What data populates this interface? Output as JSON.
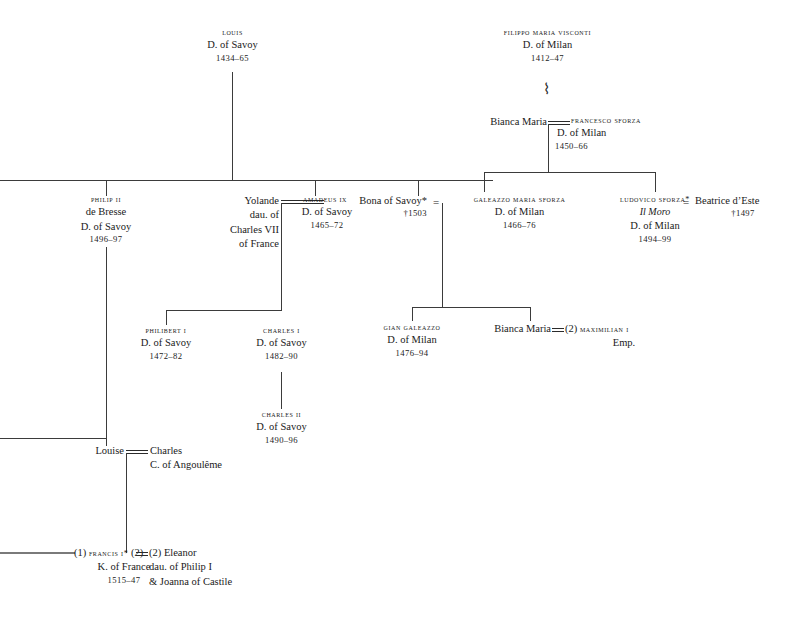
{
  "chart_title": "Genealogical table of the Houses of Savoy, Visconti and Sforza",
  "nodes": {
    "louis": {
      "name": "LOUIS",
      "realm": "D. of Savoy",
      "dates": "1434–65"
    },
    "filippo": {
      "name": "FILIPPO MARIA VISCONTI",
      "realm": "D. of Milan",
      "dates": "1412–47"
    },
    "bianca_maria_sr": {
      "name": "Bianca Maria"
    },
    "francesco_sforza": {
      "name": "FRANCESCO SFORZA",
      "realm": "D. of Milan",
      "dates": "1450–66"
    },
    "philip_ii": {
      "name": "PHILIP II",
      "epithet": "de Bresse",
      "realm": "D. of Savoy",
      "dates": "1496–97"
    },
    "yolande": {
      "name": "Yolande",
      "line2": "dau. of",
      "line3": "Charles VII",
      "line4": "of France"
    },
    "amadeus_ix": {
      "name": "AMADEUS IX",
      "realm": "D. of Savoy",
      "dates": "1465–72"
    },
    "bona_of_savoy": {
      "name": "Bona of Savoy*",
      "dates": "†1503"
    },
    "galeazzo": {
      "name": "GALEAZZO MARIA SFORZA",
      "realm": "D. of Milan",
      "dates": "1466–76"
    },
    "ludovico": {
      "name": "LUDOVICO SFORZA*",
      "epithet": "Il Moro",
      "realm": "D. of Milan",
      "dates": "1494–99"
    },
    "beatrice": {
      "name": "Beatrice d’Este",
      "dates": "†1497"
    },
    "philibert_i": {
      "name": "PHILIBERT I",
      "realm": "D. of Savoy",
      "dates": "1472–82"
    },
    "charles_i": {
      "name": "CHARLES I",
      "realm": "D. of Savoy",
      "dates": "1482–90"
    },
    "gian_galeazzo": {
      "name": "GIAN GALEAZZO",
      "realm": "D. of Milan",
      "dates": "1476–94"
    },
    "bianca_maria_jr": {
      "name": "Bianca Maria"
    },
    "maximilian": {
      "prefix": "(2)",
      "name": "MAXIMILIAN I",
      "realm": "Emp."
    },
    "charles_ii": {
      "name": "CHARLES II",
      "realm": "D. of Savoy",
      "dates": "1490–96"
    },
    "louise": {
      "name": "Louise"
    },
    "charles_angouleme": {
      "name": "Charles",
      "realm": "C. of Angoulême"
    },
    "francis_i": {
      "prefix": "(1)",
      "name": "FRANCIS I*",
      "suffix": "(2)",
      "realm": "K. of France",
      "dates": "1515–47"
    },
    "eleanor": {
      "prefix": "(2)",
      "name": "Eleanor",
      "line2": "dau. of Philip I",
      "line3": "& Joanna of Castile"
    }
  },
  "symbols": {
    "marriage": "=",
    "illegitimate_descent": "⌇",
    "dagger": "†",
    "asterisk": "*"
  },
  "colors": {
    "ink": "#1a1a1a",
    "rule": "#3b3b3b",
    "thick_rule": "#7a7a7a",
    "background": "#ffffff"
  }
}
